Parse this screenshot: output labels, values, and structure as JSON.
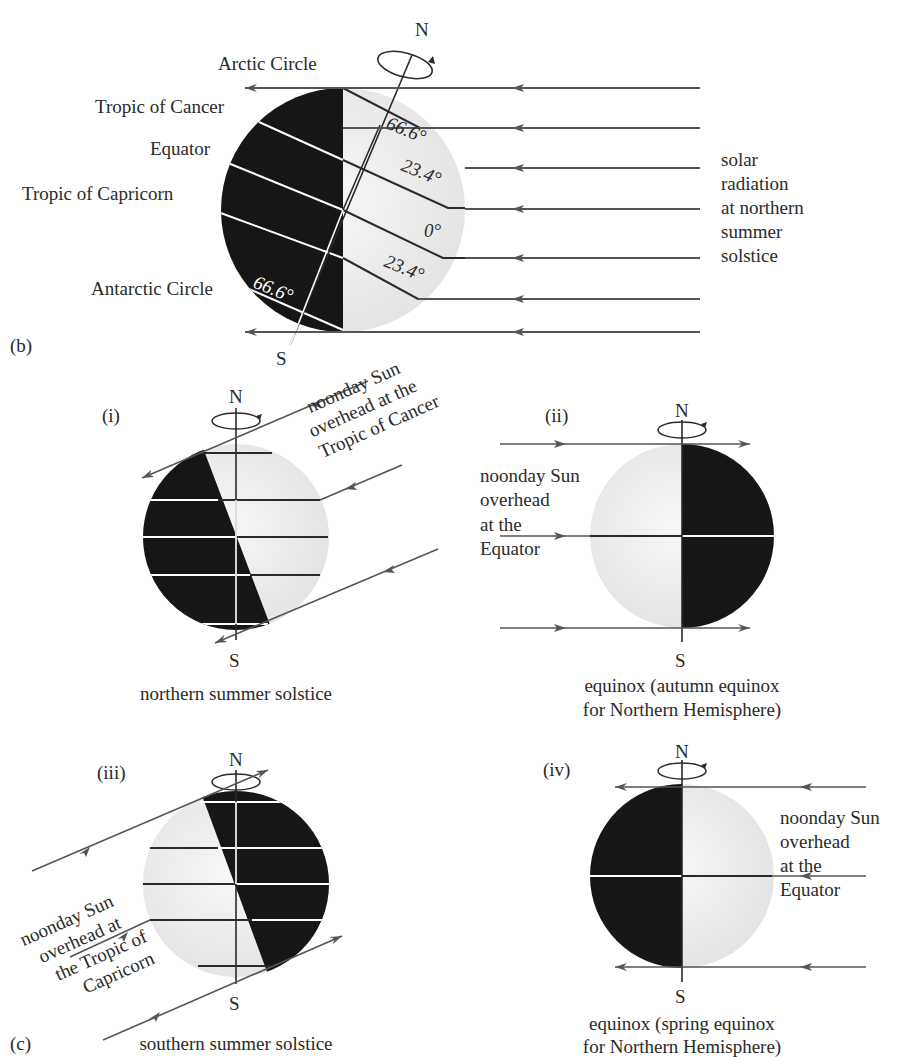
{
  "panel_b": {
    "tag": "(b)",
    "pole_north": "N",
    "pole_south": "S",
    "labels": {
      "arctic": "Arctic Circle",
      "cancer": "Tropic of Cancer",
      "equator": "Equator",
      "capricorn": "Tropic of Capricorn",
      "antarctic": "Antarctic Circle"
    },
    "angles": {
      "arctic": "66.6°",
      "cancer": "23.4°",
      "equator": "0°",
      "capricorn": "23.4°",
      "antarctic": "66.6°"
    },
    "caption_lines": [
      "solar",
      "radiation",
      "at northern",
      "summer",
      "solstice"
    ]
  },
  "panel_c": {
    "tag": "(c)",
    "panels": [
      {
        "id": "i",
        "tag": "(i)",
        "pole_north": "N",
        "pole_south": "S",
        "note_lines": [
          "noonday Sun",
          "overhead at the",
          "Tropic of Cancer"
        ],
        "caption_lines": [
          "northern summer solstice"
        ]
      },
      {
        "id": "ii",
        "tag": "(ii)",
        "pole_north": "N",
        "pole_south": "S",
        "note_lines": [
          "noonday Sun",
          "overhead",
          "at the",
          "Equator"
        ],
        "caption_lines": [
          "equinox (autumn equinox",
          "for Northern Hemisphere)"
        ]
      },
      {
        "id": "iii",
        "tag": "(iii)",
        "pole_north": "N",
        "pole_south": "S",
        "note_lines": [
          "noonday Sun",
          "overhead at",
          "the Tropic of",
          "Capricorn"
        ],
        "caption_lines": [
          "southern summer solstice"
        ]
      },
      {
        "id": "iv",
        "tag": "(iv)",
        "pole_north": "N",
        "pole_south": "S",
        "note_lines": [
          "noonday Sun",
          "overhead",
          "at the",
          "Equator"
        ],
        "caption_lines": [
          "equinox (spring equinox",
          "for Northern Hemisphere)"
        ]
      }
    ]
  },
  "colors": {
    "night": "#161616",
    "day": "#ececec",
    "ray": "#555555",
    "text": "#2a2a2a"
  }
}
